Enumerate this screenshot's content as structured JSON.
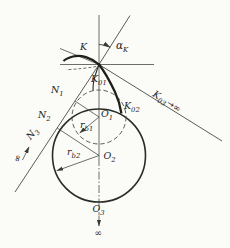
{
  "colors": {
    "background": "#fbfbf8",
    "thin_line": "#4a4a44",
    "thick_curve": "#1e1e1a",
    "label_text": "#24241f"
  },
  "labels": {
    "k": {
      "main": "K"
    },
    "alpha_k": {
      "main": "α",
      "sub": "K"
    },
    "k01": {
      "main": "K",
      "sub": "01"
    },
    "k02": {
      "main": "K",
      "sub": "02"
    },
    "k03": {
      "main": "K",
      "sub": "03",
      "arrow": "→",
      "infinity": "∞"
    },
    "n1": {
      "main": "N",
      "sub": "1"
    },
    "n2": {
      "main": "N",
      "sub": "2"
    },
    "n3": {
      "main": "N",
      "sub": "3"
    },
    "o1": {
      "main": "O",
      "sub": "1"
    },
    "o2": {
      "main": "O",
      "sub": "2"
    },
    "o3": {
      "main": "O",
      "sub": "3"
    },
    "rb1": {
      "main": "r",
      "sub": "b1"
    },
    "rb2": {
      "main": "r",
      "sub": "b2"
    },
    "infinity_n3": "∞",
    "infinity_o3": "∞"
  }
}
